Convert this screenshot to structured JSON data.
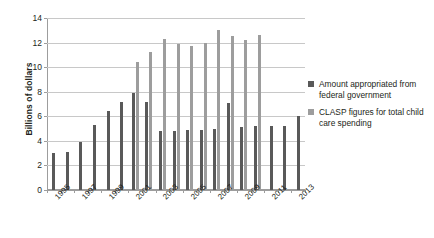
{
  "chart_data": {
    "type": "bar",
    "title": "",
    "xlabel": "",
    "ylabel": "Billions of dollars",
    "ylim": [
      0,
      14
    ],
    "ytick_values": [
      0,
      2,
      4,
      6,
      8,
      10,
      12,
      14
    ],
    "ytick_labels": [
      "0",
      "2",
      "4",
      "6",
      "8",
      "10",
      "12",
      "14"
    ],
    "grid": true,
    "legend_position": "right",
    "categories": [
      "1995",
      "1996",
      "1997",
      "1998",
      "1999",
      "2000",
      "2001",
      "2002",
      "2003",
      "2004",
      "2005",
      "2006",
      "2007",
      "2008",
      "2009",
      "2010",
      "2011",
      "2012",
      "2013"
    ],
    "xtick_labels_shown": [
      "1995",
      "1997",
      "1999",
      "2001",
      "2003",
      "2005",
      "2007",
      "2009",
      "2011",
      "2013"
    ],
    "series": [
      {
        "name": "Amount appropriated from federal government",
        "color": "#595959",
        "values": [
          3.0,
          3.1,
          3.9,
          5.3,
          6.4,
          7.2,
          7.9,
          7.2,
          4.8,
          4.8,
          4.9,
          4.9,
          5.0,
          7.1,
          5.1,
          5.2,
          5.2,
          5.2,
          6.0
        ]
      },
      {
        "name": "CLASP figures for total child care spending",
        "color": "#9d9d9d",
        "values": [
          null,
          null,
          null,
          null,
          null,
          null,
          10.4,
          11.2,
          12.3,
          11.9,
          11.7,
          12.0,
          13.0,
          12.5,
          12.2,
          12.6,
          null,
          null,
          null
        ]
      }
    ]
  },
  "legend": {
    "items": [
      {
        "label": "Amount appropriated from federal government",
        "swatch": "dark"
      },
      {
        "label": "CLASP figures for total child care spending",
        "swatch": "light"
      }
    ]
  },
  "axis": {
    "y_title": "Billions of dollars"
  }
}
